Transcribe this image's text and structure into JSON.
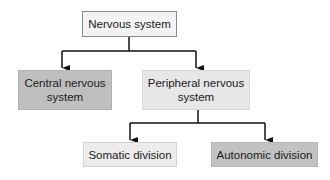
{
  "diagram": {
    "type": "hierarchy",
    "root": {
      "label": "Nervous system",
      "fill": "#f3f3f3"
    },
    "level1": [
      {
        "label_line1": "Central nervous",
        "label_line2": "system",
        "fill": "#bfbfbf"
      },
      {
        "label_line1": "Peripheral nervous",
        "label_line2": "system",
        "fill": "#e7e7e7"
      }
    ],
    "level2": [
      {
        "label": "Somatic division",
        "fill": "#ececec"
      },
      {
        "label": "Autonomic division",
        "fill": "#c2c2c2"
      }
    ],
    "edges": [
      {
        "from": "Nervous system",
        "to": "Central nervous system"
      },
      {
        "from": "Nervous system",
        "to": "Peripheral nervous system"
      },
      {
        "from": "Peripheral nervous system",
        "to": "Somatic division"
      },
      {
        "from": "Peripheral nervous system",
        "to": "Autonomic division"
      }
    ],
    "line_color": "#111111"
  }
}
